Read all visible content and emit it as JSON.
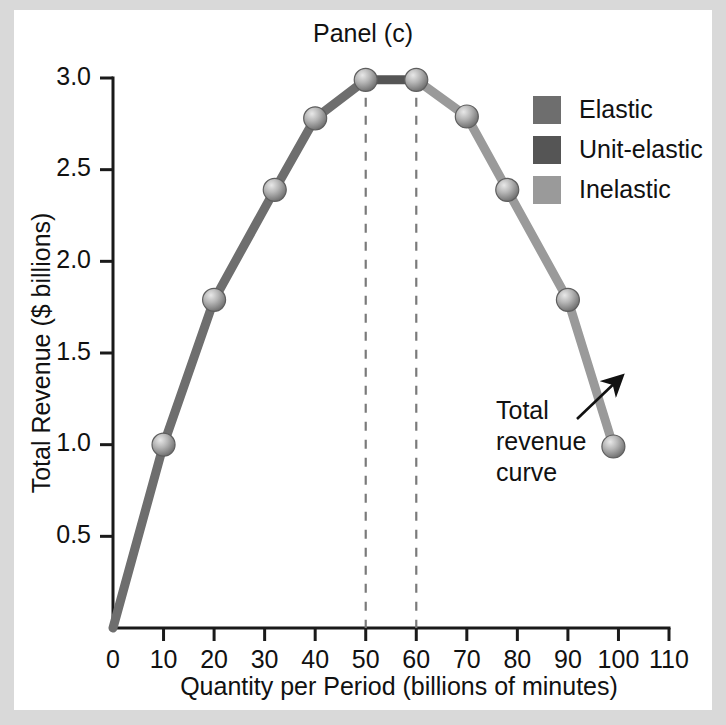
{
  "figure": {
    "title": "Panel (c)",
    "background": "#ffffff",
    "frame_color": "#d9d9d9"
  },
  "annotation": {
    "line1": "Total",
    "line2": "revenue",
    "line3": "curve",
    "arrow": "arrow-up-right"
  },
  "legend": {
    "position": "top-right",
    "items": [
      {
        "label": "Elastic",
        "color": "#6e6e6e"
      },
      {
        "label": "Unit-elastic",
        "color": "#555555"
      },
      {
        "label": "Inelastic",
        "color": "#9a9a9a"
      }
    ]
  },
  "chart_data": {
    "type": "line",
    "title": "Panel (c)",
    "xlabel": "Quantity per Period (billions of minutes)",
    "ylabel": "Total Revenue ($ billions)",
    "xlim": [
      0,
      110
    ],
    "ylim": [
      0,
      3.0
    ],
    "grid": false,
    "xticks": [
      0,
      10,
      20,
      30,
      40,
      50,
      60,
      70,
      80,
      90,
      100,
      110
    ],
    "xticklabels": [
      "0",
      "10",
      "20",
      "30",
      "40",
      "50",
      "60",
      "70",
      "80",
      "90",
      "100",
      "110"
    ],
    "yticks": [
      0.5,
      1.0,
      1.5,
      2.0,
      2.5,
      3.0
    ],
    "yticklabels": [
      "0.5",
      "1.0",
      "1.5",
      "2.0",
      "2.5",
      "3.0"
    ],
    "x": [
      0,
      10,
      20,
      32,
      40,
      50,
      60,
      70,
      78,
      90,
      99
    ],
    "y": [
      0.0,
      1.0,
      1.79,
      2.39,
      2.78,
      2.99,
      2.99,
      2.79,
      2.39,
      1.79,
      0.99
    ],
    "markers": [
      {
        "x": 10,
        "y": 1.0
      },
      {
        "x": 20,
        "y": 1.79
      },
      {
        "x": 32,
        "y": 2.39
      },
      {
        "x": 40,
        "y": 2.78
      },
      {
        "x": 50,
        "y": 2.99
      },
      {
        "x": 60,
        "y": 2.99
      },
      {
        "x": 70,
        "y": 2.79
      },
      {
        "x": 78,
        "y": 2.39
      },
      {
        "x": 90,
        "y": 1.79
      },
      {
        "x": 99,
        "y": 0.99
      }
    ],
    "segments": [
      {
        "name": "Elastic",
        "from_x": 0,
        "to_x": 50,
        "color": "#6e6e6e"
      },
      {
        "name": "Unit-elastic",
        "from_x": 50,
        "to_x": 60,
        "color": "#555555"
      },
      {
        "name": "Inelastic",
        "from_x": 60,
        "to_x": 99,
        "color": "#9a9a9a"
      }
    ],
    "guides": [
      {
        "x": 50,
        "y_top": 2.99,
        "y_bottom": 0.0
      },
      {
        "x": 60,
        "y_top": 2.99,
        "y_bottom": 0.0
      }
    ]
  }
}
